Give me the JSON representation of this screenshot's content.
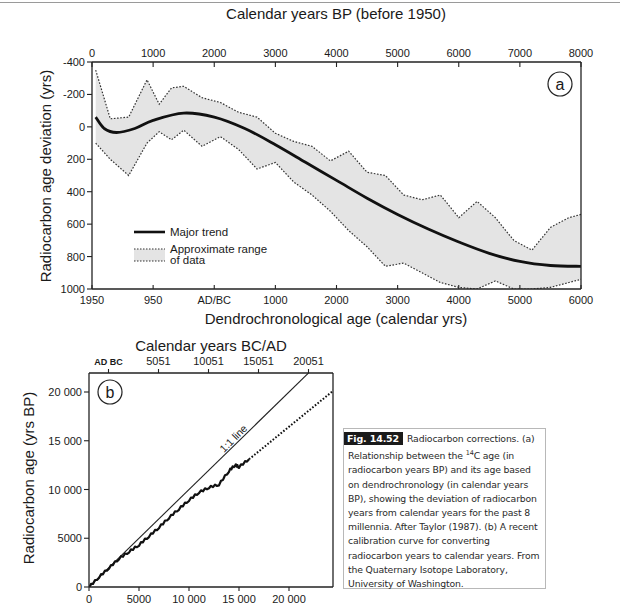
{
  "figure": {
    "caption": {
      "label": "Fig. 14.52",
      "lines": [
        "Radiocarbon corrections. (a)",
        "Relationship between the ",
        "14",
        "C age (in",
        "radiocarbon years BP) and its age based on dendrochronology (in calendar years BP), showing the deviation of radiocarbon years from calendar years for the past 8 millennia. After Taylor (1987). (b) A recent calibration curve for converting radiocarbon years to calendar years. From the Quaternary Isotope Laboratory, University of Washington."
      ]
    }
  },
  "chart_data": [
    {
      "panel": "a",
      "type": "line",
      "title": "",
      "top_xlabel": "Calendar years BP (before 1950)",
      "top_xticks": [
        "0",
        "1000",
        "2000",
        "3000",
        "4000",
        "5000",
        "6000",
        "7000",
        "8000"
      ],
      "xlabel": "Dendrochronological age (calendar yrs)",
      "xticks": [
        "1950",
        "950",
        "AD/BC",
        "1000",
        "2000",
        "3000",
        "4000",
        "5000",
        "6000"
      ],
      "ylabel": "Radiocarbon age deviation (yrs)",
      "yticks": [
        "-400",
        "-200",
        "0",
        "200",
        "400",
        "600",
        "800",
        "1000"
      ],
      "ylim": [
        -400,
        1000
      ],
      "xlim_calendar_bp": [
        0,
        8000
      ],
      "legend": [
        {
          "label": "Major trend",
          "style": "solid-thick"
        },
        {
          "label": "Approximate range of data",
          "style": "dotted-band"
        }
      ],
      "panel_marker": "a",
      "series": [
        {
          "name": "Major trend",
          "x": [
            60,
            200,
            400,
            700,
            1000,
            1500,
            2000,
            2500,
            3000,
            3500,
            4000,
            4500,
            5000,
            5500,
            6000,
            6500,
            7000,
            7500,
            8000
          ],
          "y": [
            -60,
            10,
            35,
            10,
            -40,
            -85,
            -60,
            10,
            110,
            220,
            330,
            440,
            540,
            630,
            710,
            780,
            830,
            855,
            860
          ]
        },
        {
          "name": "Approximate range of data (upper)",
          "x": [
            60,
            300,
            600,
            900,
            1100,
            1300,
            1500,
            1800,
            2100,
            2400,
            2700,
            3000,
            3300,
            3600,
            3900,
            4200,
            4500,
            4800,
            5100,
            5400,
            5700,
            6000,
            6300,
            6600,
            6900,
            7200,
            7500,
            7800,
            8000
          ],
          "y": [
            -350,
            -50,
            -60,
            -290,
            -140,
            -240,
            -250,
            -180,
            -150,
            -90,
            -60,
            40,
            90,
            120,
            210,
            150,
            280,
            300,
            420,
            450,
            420,
            560,
            460,
            560,
            700,
            760,
            620,
            560,
            540
          ],
          "approx": true
        },
        {
          "name": "Approximate range of data (lower)",
          "x": [
            60,
            300,
            600,
            900,
            1100,
            1300,
            1500,
            1800,
            2100,
            2400,
            2700,
            3000,
            3300,
            3600,
            3900,
            4200,
            4500,
            4800,
            5100,
            5400,
            5700,
            6000,
            6300,
            6600,
            6900,
            7200,
            7500,
            7800,
            8000
          ],
          "y": [
            100,
            200,
            300,
            100,
            30,
            80,
            20,
            120,
            60,
            140,
            260,
            220,
            340,
            420,
            520,
            640,
            740,
            860,
            840,
            900,
            960,
            990,
            1000,
            950,
            1000,
            1000,
            990,
            960,
            940
          ],
          "approx": true
        }
      ]
    },
    {
      "panel": "b",
      "type": "line",
      "top_xlabel": "Calendar years BC/AD",
      "top_xticks": [
        "AD BC",
        "5051",
        "10051",
        "15051",
        "20051"
      ],
      "xlabel": "",
      "xticks": [
        "0",
        "5000",
        "10 000",
        "15 000",
        "20 000"
      ],
      "ylabel": "Radiocarbon age (yrs BP)",
      "yticks": [
        "0",
        "5000",
        "10 000",
        "15 000",
        "20 000"
      ],
      "xlim": [
        0,
        24500
      ],
      "ylim": [
        0,
        22000
      ],
      "panel_marker": "b",
      "annotations": [
        "1:1 line"
      ],
      "series": [
        {
          "name": "1:1 line",
          "x": [
            0,
            22000
          ],
          "y": [
            0,
            22000
          ]
        },
        {
          "name": "Calibration curve",
          "x": [
            0,
            1000,
            2000,
            3000,
            4000,
            5000,
            6000,
            7000,
            8000,
            9000,
            10000,
            11000,
            12000,
            13000,
            14000,
            14600,
            15000,
            16000
          ],
          "y": [
            0,
            1000,
            1950,
            2900,
            3600,
            4300,
            5200,
            6100,
            7100,
            8000,
            8900,
            9700,
            10200,
            10500,
            11900,
            12500,
            12300,
            13100
          ]
        },
        {
          "name": "Calibration curve (extrapolated, dotted)",
          "x": [
            16000,
            24500
          ],
          "y": [
            13100,
            20200
          ]
        }
      ]
    }
  ]
}
